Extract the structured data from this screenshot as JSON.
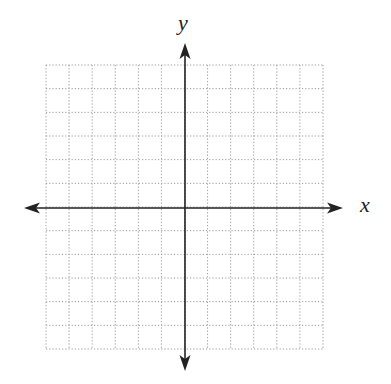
{
  "diagram": {
    "type": "coordinate-plane",
    "x_label": "x",
    "y_label": "y",
    "grid": {
      "columns": 12,
      "rows": 12,
      "left": 46,
      "top": 65,
      "right": 323,
      "bottom": 349,
      "line_style": "dotted",
      "line_color": "#9a9a9a"
    },
    "axes": {
      "color": "#222222",
      "x_axis_y": 208,
      "x_axis_from": 24,
      "x_axis_to": 343,
      "y_axis_x": 185,
      "y_axis_from": 43,
      "y_axis_to": 371
    }
  }
}
